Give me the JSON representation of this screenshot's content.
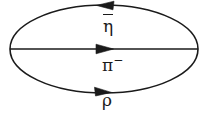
{
  "figure": {
    "name": "particle-loop-diagram",
    "type": "feynman-loop-diagram",
    "background_color": "#ffffff",
    "stroke_color": "#1a1a1a",
    "width": 208,
    "height": 115
  },
  "ellipse": {
    "center_x": 104,
    "center_y": 49,
    "radius_x": 94,
    "radius_y": 44,
    "stroke_width": 1.6
  },
  "lines": [
    {
      "id": "top-arc",
      "label": "η",
      "label_has_overbar": true,
      "label_display": "η̄",
      "label_superscript": "",
      "arrow_direction": "left",
      "arrow_tip_x": 97,
      "arrow_y": 5,
      "label_x": 103,
      "label_y": 14
    },
    {
      "id": "middle-line",
      "label": "π",
      "label_has_overbar": false,
      "label_display": "π⁻",
      "label_superscript": "−",
      "arrow_direction": "right",
      "arrow_tip_x": 113,
      "arrow_y": 49,
      "label_x": 102,
      "label_y": 54
    },
    {
      "id": "bottom-arc",
      "label": "ρ",
      "label_has_overbar": false,
      "label_display": "ρ",
      "label_superscript": "",
      "arrow_direction": "right",
      "arrow_tip_x": 111,
      "arrow_y": 92,
      "label_x": 102,
      "label_y": 92
    }
  ],
  "labels": {
    "eta_bar_glyph": "η",
    "pi_glyph": "π",
    "pi_charge": "−",
    "rho_glyph": "ρ"
  }
}
